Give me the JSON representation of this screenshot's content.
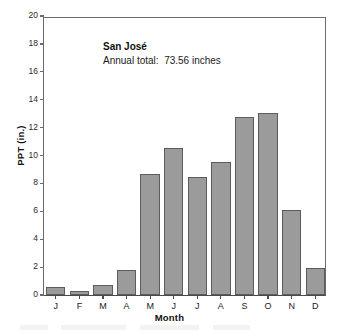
{
  "chart_data": {
    "type": "bar",
    "title": "San José",
    "subtitle": "Annual total:  73.56 inches",
    "xlabel": "Month",
    "ylabel": "PPT (in.)",
    "categories": [
      "J",
      "F",
      "M",
      "A",
      "M",
      "J",
      "J",
      "A",
      "S",
      "O",
      "N",
      "D"
    ],
    "values": [
      0.55,
      0.3,
      0.75,
      1.8,
      8.7,
      10.55,
      8.45,
      9.55,
      12.75,
      13.05,
      6.1,
      1.95
    ],
    "ylim": [
      0,
      20
    ],
    "yticks": [
      0,
      2,
      4,
      6,
      8,
      10,
      12,
      14,
      16,
      18,
      20
    ],
    "ytick_labels": [
      "0",
      "2",
      "4",
      "6",
      "8",
      "10",
      "12",
      "14",
      "16",
      "18",
      "20"
    ],
    "grid": false,
    "legend": false,
    "bar_color": "#9b9b9b",
    "bar_edge_color": "#5c5c5c",
    "axis_color": "#5a5a5a"
  },
  "annotation": {
    "station_name": "San José",
    "annual_total_text": "Annual total:  73.56 inches"
  }
}
